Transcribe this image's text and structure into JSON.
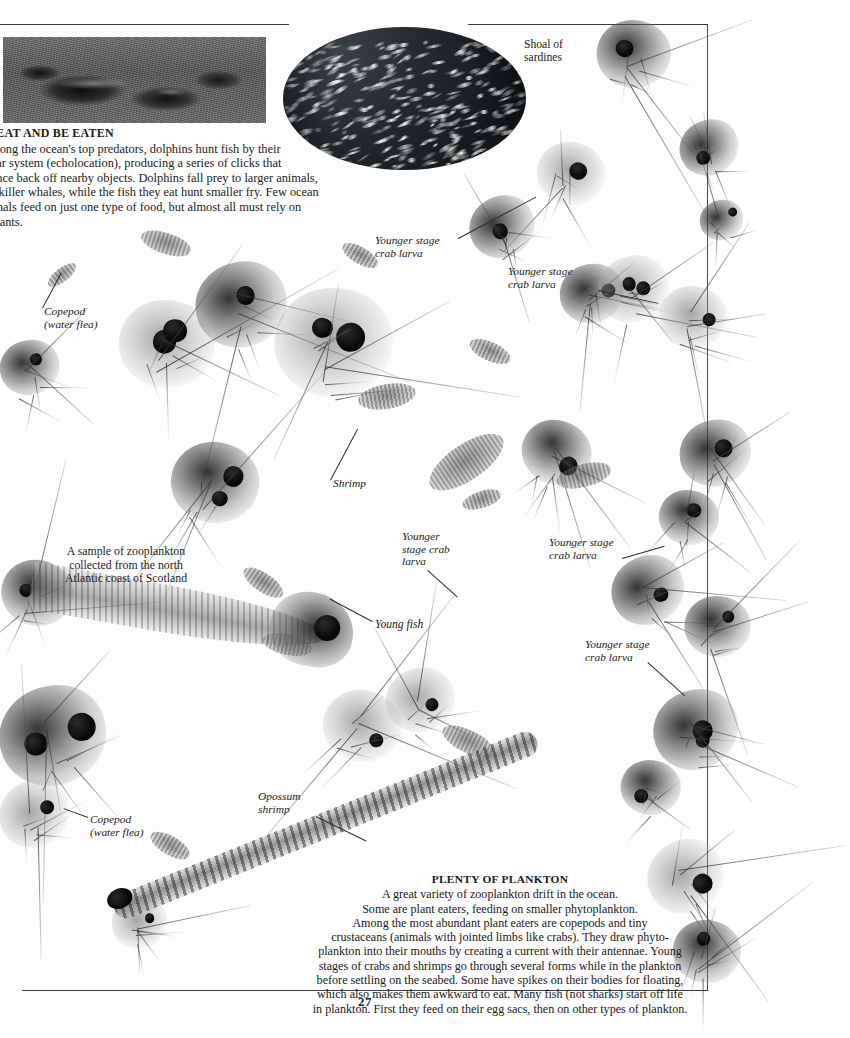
{
  "page": {
    "number": "27",
    "background_color": "#fdfdfd",
    "rule_color": "#3a3a3a"
  },
  "article": {
    "heading": "EAT AND BE EATEN",
    "heading_bullet": "▸",
    "lines": [
      "mong the ocean's top predators, dolphins hunt fish by their",
      "nar system (echolocation), producing a series of clicks that",
      "unce back off nearby objects. Dolphins fall prey to larger animals,",
      "e killer whales, while the fish they eat hunt smaller fry. Few ocean",
      "imals feed on just one type of food, but almost all must rely on plants."
    ]
  },
  "plenty": {
    "heading": "PLENTY OF PLANKTON",
    "lines": [
      "A great variety of zooplankton drift in the ocean.",
      "Some are plant eaters, feeding on smaller phytoplankton.",
      "Among the most abundant plant eaters are copepods and tiny",
      "crustaceans (animals with jointed limbs like crabs). They draw phyto-",
      "plankton into their mouths by creating a current with their antennae. Young",
      "stages of crabs and shrimps go through several forms while in the plankton",
      "before settling on the seabed. Some have spikes on their bodies for floating,",
      "which also makes them awkward to eat. Many fish (not sharks) start off life",
      "in plankton. First they feed on their egg sacs, then on other types of plankton."
    ]
  },
  "sample_caption": {
    "lines": [
      "A sample of zooplankton",
      "collected from the north",
      "Atlantic coast of Scotland"
    ]
  },
  "labels": {
    "shoal": "Shoal of\nsardines",
    "crab_larva_1": "Younger stage\ncrab larva",
    "crab_larva_2": "Younger stage\ncrab larva",
    "copepod_top": "Copepod\n(water flea)",
    "shrimp": "Shrimp",
    "crab_larva_3": "Younger\nstage crab\nlarva",
    "crab_larva_4": "Younger stage\ncrab larva",
    "young_fish": "Young fish",
    "crab_larva_5": "Younger stage\ncrab larva",
    "opossum_shrimp": "Opossum\nshrimp",
    "copepod_bottom": "Copepod\n(water flea)"
  },
  "images": {
    "engraving": "dolphins-engraving",
    "sardine_photo": "shoal-of-sardines-circular-photo"
  }
}
